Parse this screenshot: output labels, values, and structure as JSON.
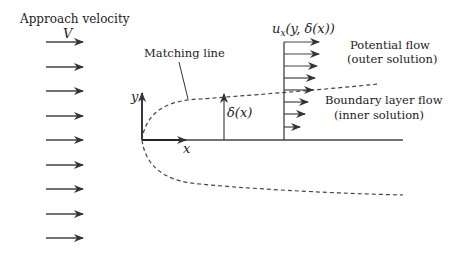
{
  "labels": {
    "approach": "Approach velocity",
    "V": "V",
    "matching": "Matching line",
    "y": "y",
    "x": "x",
    "delta": "δ(x)",
    "ux": "u",
    "ux_sub": "x",
    "ux_args": "(y, δ(x))",
    "potential_1": "Potential flow",
    "potential_2": "(outer solution)",
    "boundary_1": "Boundary layer flow",
    "boundary_2": "(inner solution)"
  },
  "colors": {
    "ink": "#333333",
    "text": "#222222"
  }
}
